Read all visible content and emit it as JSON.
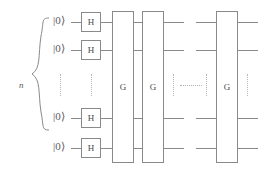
{
  "diagram": {
    "register_label": "n",
    "qubit_rows": [
      {
        "ket": "|0⟩",
        "hadamard": "H",
        "y": 22
      },
      {
        "ket": "|0⟩",
        "hadamard": "H",
        "y": 50
      },
      {
        "ket": "|0⟩",
        "hadamard": "H",
        "y": 118
      },
      {
        "ket": "|0⟩",
        "hadamard": "H",
        "y": 148
      }
    ],
    "g_gates": [
      {
        "label": "G",
        "x": 112
      },
      {
        "label": "G",
        "x": 142
      },
      {
        "label": "G",
        "x": 216
      }
    ],
    "ellipsis": {
      "vertical_symbol": "⋮",
      "horizontal_symbol": "⋯"
    },
    "colors": {
      "line": "#8a8a8a",
      "text": "#5a5a5a",
      "dotted": "#b8b8b8",
      "background": "#ffffff"
    }
  }
}
